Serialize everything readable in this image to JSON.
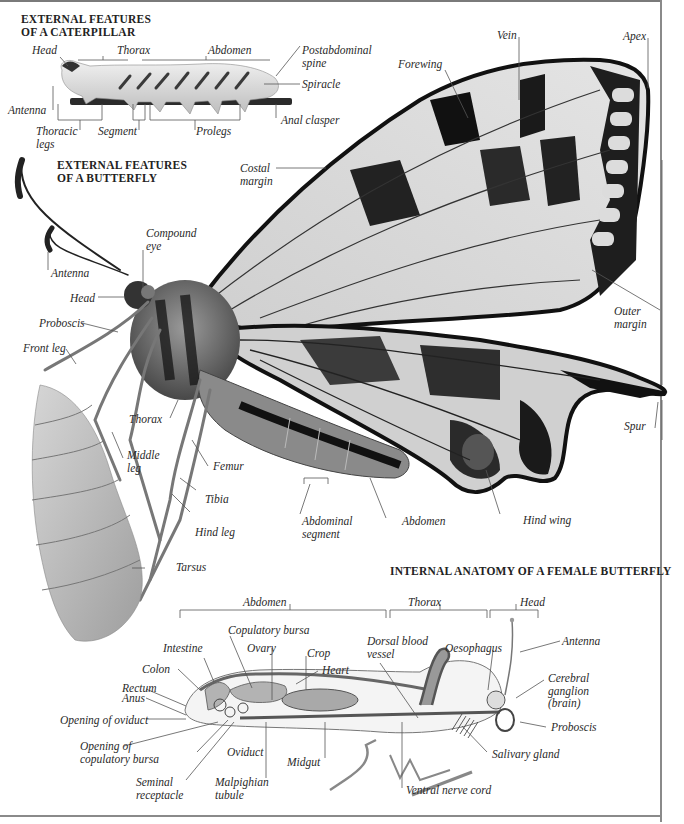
{
  "titles": {
    "caterpillar": [
      "EXTERNAL FEATURES",
      "OF A CATERPILLAR"
    ],
    "butterfly": [
      "EXTERNAL FEATURES",
      "OF A BUTTERFLY"
    ],
    "internal": "INTERNAL ANATOMY OF A FEMALE BUTTERFLY"
  },
  "caterpillar_labels": {
    "head": "Head",
    "thorax": "Thorax",
    "abdomen": "Abdomen",
    "postabdominal_spine": [
      "Postabdominal",
      "spine"
    ],
    "spiracle": "Spiracle",
    "antenna": "Antenna",
    "thoracic_legs": [
      "Thoracic",
      "legs"
    ],
    "segment": "Segment",
    "prolegs": "Prolegs",
    "anal_clasper": "Anal clasper"
  },
  "butterfly_labels": {
    "vein": "Vein",
    "apex": "Apex",
    "forewing": "Forewing",
    "costal_margin": [
      "Costal",
      "margin"
    ],
    "compound_eye": [
      "Compound",
      "eye"
    ],
    "antenna": "Antenna",
    "head": "Head",
    "proboscis": "Proboscis",
    "front_leg": "Front leg",
    "outer_margin": [
      "Outer",
      "margin"
    ],
    "thorax": "Thorax",
    "middle_leg": [
      "Middle",
      "leg"
    ],
    "femur": "Femur",
    "tibia": "Tibia",
    "hind_leg": "Hind leg",
    "abdominal_segment": [
      "Abdominal",
      "segment"
    ],
    "abdomen": "Abdomen",
    "hind_wing": "Hind wing",
    "spur": "Spur",
    "tarsus": "Tarsus"
  },
  "internal_labels": {
    "abdomen": "Abdomen",
    "thorax": "Thorax",
    "head": "Head",
    "copulatory_bursa": "Copulatory bursa",
    "intestine": "Intestine",
    "ovary": "Ovary",
    "crop": "Crop",
    "dorsal_blood_vessel": [
      "Dorsal blood",
      "vessel"
    ],
    "oesophagus": "Oesophagus",
    "antenna": "Antenna",
    "colon": "Colon",
    "heart": "Heart",
    "rectum": "Rectum",
    "anus": "Anus",
    "cerebral_ganglion": [
      "Cerebral",
      "ganglion",
      "(brain)"
    ],
    "opening_of_oviduct": "Opening of oviduct",
    "proboscis": "Proboscis",
    "opening_of_copulatory_bursa": [
      "Opening of",
      "copulatory bursa"
    ],
    "oviduct": "Oviduct",
    "midgut": "Midgut",
    "salivary_gland": "Salivary gland",
    "seminal_receptacle": [
      "Seminal",
      "receptacle"
    ],
    "malpighian_tubule": [
      "Malpighian",
      "tubule"
    ],
    "ventral_nerve_cord": "Ventral nerve cord"
  },
  "colors": {
    "ink": "#2a2a2a",
    "leader": "#555555",
    "wing_dark": "#1a1a1a",
    "wing_light": "#d8d8d8",
    "organ_fill": "#a9a9a9"
  }
}
